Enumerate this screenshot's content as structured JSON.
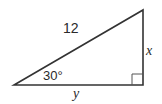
{
  "diagram": {
    "type": "right-triangle",
    "hypotenuse_label": "12",
    "vertical_leg_label": "x",
    "horizontal_leg_label": "y",
    "angle_label": "30°",
    "right_angle_marker": true,
    "stroke_color": "#333333"
  }
}
